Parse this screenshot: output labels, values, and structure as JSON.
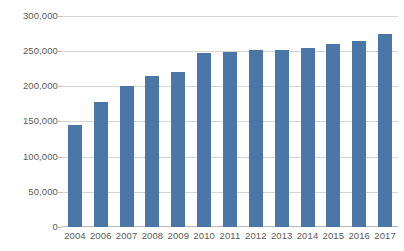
{
  "chart_data": {
    "type": "bar",
    "title": "",
    "xlabel": "",
    "ylabel": "",
    "categories": [
      "2004",
      "2006",
      "2007",
      "2008",
      "2009",
      "2010",
      "2011",
      "2012",
      "2013",
      "2014",
      "2015",
      "2016",
      "2017"
    ],
    "values": [
      145000,
      178000,
      201000,
      215000,
      220000,
      247000,
      249000,
      252000,
      252000,
      254000,
      260000,
      264000,
      275000
    ],
    "ylim": [
      0,
      300000
    ],
    "y_ticks": [
      0,
      50000,
      100000,
      150000,
      200000,
      250000,
      300000
    ],
    "y_tick_labels": [
      "0",
      "50,000",
      "100,000",
      "150,000",
      "200,000",
      "250,000",
      "300,000"
    ],
    "grid": true,
    "legend": null,
    "series": [
      {
        "name": "",
        "color": "#4a76a8",
        "values": [
          145000,
          178000,
          201000,
          215000,
          220000,
          247000,
          249000,
          252000,
          252000,
          254000,
          260000,
          264000,
          275000
        ]
      }
    ],
    "colors": {
      "bar": "#4a76a8",
      "gridline": "#d5d5d5",
      "axis_text": "#5a5a5a",
      "background": "#ffffff"
    }
  }
}
